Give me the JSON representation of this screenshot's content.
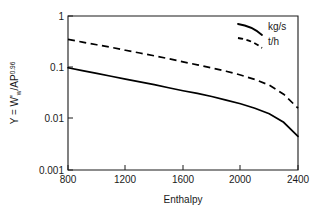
{
  "chart_data": {
    "type": "line",
    "title": "",
    "xlabel": "Enthalpy",
    "ylabel": "Y = W'w/AP0.96",
    "ylabel_parts": {
      "prefix": "Y = W'",
      "sub": "w",
      "mid": "/AP",
      "sup": "0.96"
    },
    "xlim": [
      800,
      2400
    ],
    "ylim": [
      0.001,
      1
    ],
    "yscale": "log",
    "xscale": "linear",
    "grid": false,
    "legend_position": "top-right",
    "xticks": [
      "800",
      "1200",
      "1600",
      "2000",
      "2400"
    ],
    "xtick_values": [
      800,
      1200,
      1600,
      2000,
      2400
    ],
    "yticks": [
      "1",
      "0.1",
      "0.01",
      "0.001"
    ],
    "ytick_values": [
      1,
      0.1,
      0.01,
      0.001
    ],
    "series": [
      {
        "name": "kg/s",
        "style": "solid",
        "x": [
          800,
          900,
          1000,
          1100,
          1200,
          1300,
          1400,
          1500,
          1600,
          1700,
          1800,
          1900,
          2000,
          2100,
          2200,
          2300,
          2400
        ],
        "values": [
          0.098,
          0.086,
          0.076,
          0.067,
          0.059,
          0.052,
          0.046,
          0.04,
          0.035,
          0.031,
          0.027,
          0.023,
          0.0195,
          0.016,
          0.0125,
          0.0085,
          0.0045
        ]
      },
      {
        "name": "t/h",
        "style": "dashed",
        "x": [
          800,
          900,
          1000,
          1100,
          1200,
          1300,
          1400,
          1500,
          1600,
          1700,
          1800,
          1900,
          2000,
          2100,
          2200,
          2300,
          2400
        ],
        "values": [
          0.35,
          0.31,
          0.275,
          0.245,
          0.215,
          0.19,
          0.168,
          0.147,
          0.128,
          0.112,
          0.097,
          0.084,
          0.071,
          0.058,
          0.045,
          0.03,
          0.016
        ]
      }
    ],
    "legend": [
      {
        "label": "kg/s",
        "style": "solid"
      },
      {
        "label": "t/h",
        "style": "dashed"
      }
    ]
  },
  "axes": {
    "x_title": "Enthalpy"
  }
}
